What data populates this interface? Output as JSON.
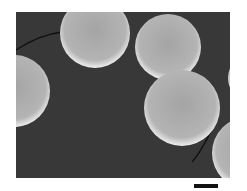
{
  "image": {
    "description": "Grayscale electron micrograph of smooth spheres on dark substrate",
    "background_color": "#3a3a3a",
    "sphere_color": "#a8a8a8",
    "sphere_edge_color": "#e6e6e6",
    "sphere_count_visible": 6
  },
  "scale_bar": {
    "label": ""
  }
}
